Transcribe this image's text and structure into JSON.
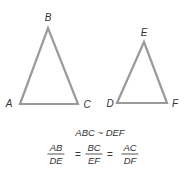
{
  "diagram": {
    "stroke_color": "#9a9a9a",
    "label_color": "#333333",
    "triangle_abc": {
      "vertices": {
        "A": {
          "label": "A",
          "x": 20,
          "y": 104
        },
        "B": {
          "label": "B",
          "x": 48,
          "y": 28
        },
        "C": {
          "label": "C",
          "x": 78,
          "y": 104
        }
      }
    },
    "triangle_def": {
      "vertices": {
        "D": {
          "label": "D",
          "x": 117,
          "y": 103
        },
        "E": {
          "label": "E",
          "x": 144,
          "y": 42
        },
        "F": {
          "label": "F",
          "x": 167,
          "y": 103
        }
      }
    },
    "similarity_statement": "ABC ~ DEF",
    "proportion": {
      "fractions": [
        {
          "numerator": "AB",
          "denominator": "DE"
        },
        {
          "numerator": "BC",
          "denominator": "EF"
        },
        {
          "numerator": "AC",
          "denominator": "DF"
        }
      ],
      "equals_sign": "="
    }
  }
}
